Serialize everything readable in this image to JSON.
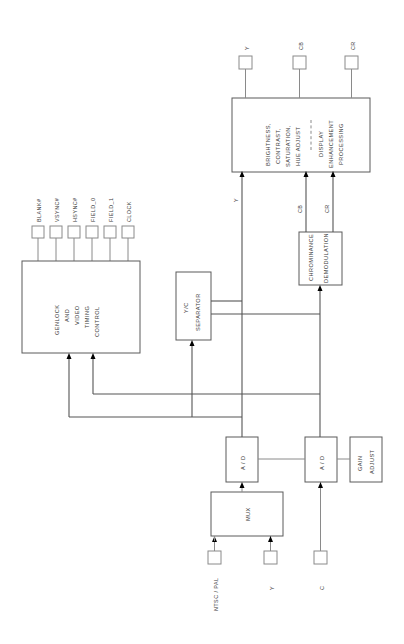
{
  "diagram": {
    "orientation": "rotated-90-ccw",
    "background_color": "#ffffff",
    "line_color": "#8a8a8a",
    "text_color": "#3b3b3b",
    "junction_color": "#000000"
  },
  "blocks": {
    "genlock": {
      "line1": "GENLOCK",
      "line2": "AND",
      "line3": "VIDEO",
      "line4": "TIMING",
      "line5": "CONTROL"
    },
    "yc_separator": {
      "line1": "Y/C",
      "line2": "SEPARATOR"
    },
    "chroma_demod": {
      "line1": "CHROMINANCE",
      "line2": "DEMODULATION"
    },
    "display_proc": {
      "line1": "BRIGHTNESS,",
      "line2": "CONTRAST,",
      "line3": "SATURATION,",
      "line4": "HUE  ADJUST",
      "line5": "DISPLAY",
      "line6": "ENHANCEMENT",
      "line7": "PROCESSING"
    },
    "adc_luma": {
      "label": "A / D"
    },
    "adc_chroma": {
      "label": "A / D"
    },
    "gain_adjust": {
      "line1": "GAIN",
      "line2": "ADJUST"
    },
    "mux": {
      "label": "MUX"
    }
  },
  "pins": {
    "timing_outputs": [
      {
        "label": "BLANK#"
      },
      {
        "label": "VSYNC#"
      },
      {
        "label": "HSYNC#"
      },
      {
        "label": "FIELD_0"
      },
      {
        "label": "FIELD_1"
      },
      {
        "label": "CLOCK"
      }
    ],
    "video_outputs": [
      {
        "label": "Y"
      },
      {
        "label": "CB"
      },
      {
        "label": "CR"
      }
    ],
    "video_inputs": [
      {
        "label": "NTSC / PAL"
      },
      {
        "label": "Y"
      },
      {
        "label": "C"
      }
    ]
  },
  "signal_labels": {
    "y_to_display": "Y",
    "cb_to_display": "CB",
    "cr_to_display": "CR",
    "y_from_sep": "Y",
    "cb_from_demod": "CB",
    "cr_from_demod": "CR"
  }
}
